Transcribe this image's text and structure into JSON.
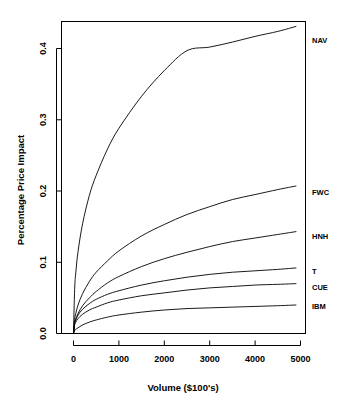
{
  "chart_data": {
    "type": "line",
    "title": "",
    "xlabel": "Volume ($100's)",
    "ylabel": "Percentage Price Impact",
    "xlim": [
      0,
      5200
    ],
    "ylim": [
      0.0,
      0.44
    ],
    "grid": false,
    "legend_position": "right-inline-labels",
    "xticks": [
      0,
      1000,
      2000,
      3000,
      4000,
      5000
    ],
    "xtick_labels": [
      "0",
      "1000",
      "2000",
      "3000",
      "4000",
      "5000"
    ],
    "yticks": [
      0.0,
      0.1,
      0.2,
      0.3,
      0.4
    ],
    "ytick_labels": [
      "0.0",
      "0.1",
      "0.2",
      "0.3",
      "0.4"
    ],
    "x": [
      0,
      25,
      50,
      100,
      200,
      350,
      500,
      750,
      1000,
      1500,
      2000,
      2500,
      3000,
      3500,
      4000,
      4500,
      4900
    ],
    "series": [
      {
        "name": "NAV",
        "label": "NAV",
        "values": [
          0.0,
          0.062,
          0.085,
          0.115,
          0.154,
          0.194,
          0.222,
          0.259,
          0.288,
          0.333,
          0.369,
          0.397,
          0.402,
          0.409,
          0.417,
          0.424,
          0.431
        ]
      },
      {
        "name": "FWC",
        "label": "FWC",
        "values": [
          0.0,
          0.02,
          0.028,
          0.04,
          0.056,
          0.073,
          0.086,
          0.102,
          0.116,
          0.137,
          0.153,
          0.167,
          0.178,
          0.188,
          0.195,
          0.202,
          0.207
        ]
      },
      {
        "name": "HNH",
        "label": "HNH",
        "values": [
          0.0,
          0.014,
          0.02,
          0.028,
          0.039,
          0.05,
          0.059,
          0.071,
          0.08,
          0.094,
          0.105,
          0.114,
          0.122,
          0.129,
          0.134,
          0.139,
          0.143
        ]
      },
      {
        "name": "T",
        "label": "T",
        "values": [
          0.0,
          0.014,
          0.019,
          0.026,
          0.034,
          0.042,
          0.048,
          0.055,
          0.06,
          0.068,
          0.074,
          0.079,
          0.083,
          0.086,
          0.088,
          0.09,
          0.092
        ]
      },
      {
        "name": "CUE",
        "label": "CUE",
        "values": [
          0.0,
          0.012,
          0.016,
          0.021,
          0.027,
          0.033,
          0.037,
          0.043,
          0.047,
          0.053,
          0.057,
          0.061,
          0.064,
          0.066,
          0.068,
          0.069,
          0.07
        ]
      },
      {
        "name": "IBM",
        "label": "IBM",
        "values": [
          0.0,
          0.004,
          0.006,
          0.008,
          0.012,
          0.016,
          0.019,
          0.023,
          0.026,
          0.03,
          0.033,
          0.035,
          0.036,
          0.037,
          0.038,
          0.039,
          0.04
        ]
      }
    ]
  },
  "labels": {
    "nav": "NAV",
    "fwc": "FWC",
    "hnh": "HNH",
    "t": "T",
    "cue": "CUE",
    "ibm": "IBM"
  },
  "axis": {
    "x_title": "Volume ($100's)",
    "y_title": "Percentage Price Impact",
    "xt0": "0",
    "xt1": "1000",
    "xt2": "2000",
    "xt3": "3000",
    "xt4": "4000",
    "xt5": "5000",
    "yt0": "0.0",
    "yt1": "0.1",
    "yt2": "0.2",
    "yt3": "0.3",
    "yt4": "0.4"
  },
  "colors": {
    "background": "#ffffff",
    "ink": "#000000"
  }
}
